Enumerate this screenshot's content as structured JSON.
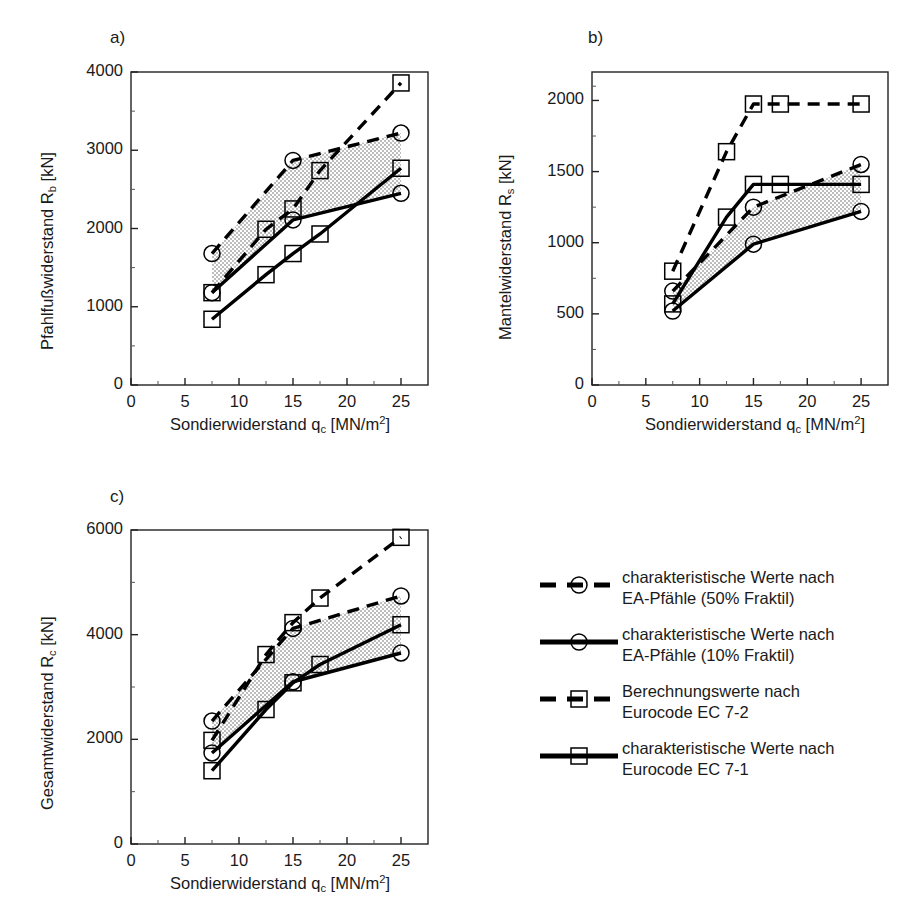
{
  "figure": {
    "panels": [
      {
        "tag": "a)",
        "ylabel_text": "Pfahlfußwiderstand R",
        "ylabel_sub": "b",
        "ylabel_unit": " [kN]"
      },
      {
        "tag": "b)",
        "ylabel_text": "Mantelwiderstand R",
        "ylabel_sub": "s",
        "ylabel_unit": " [kN]"
      },
      {
        "tag": "c)",
        "ylabel_text": "Gesamtwiderstand R",
        "ylabel_sub": "c",
        "ylabel_unit": " [kN]"
      }
    ],
    "xlabel_text": "Sondierwiderstand q",
    "xlabel_sub": "c",
    "xlabel_unit": " [MN/m",
    "xlabel_sup": "2",
    "xlabel_close": "]"
  },
  "legend": {
    "items": [
      {
        "label": "charakteristische Werte nach\nEA-Pfähle (50% Fraktil)",
        "marker": "circle",
        "style": "dashed"
      },
      {
        "label": "charakteristische Werte nach\nEA-Pfähle (10% Fraktil)",
        "marker": "circle",
        "style": "solid"
      },
      {
        "label": "Berechnungswerte nach\nEurocode EC 7-2",
        "marker": "square",
        "style": "dashed"
      },
      {
        "label": "charakteristische Werte nach\nEurocode EC 7-1",
        "marker": "square",
        "style": "solid"
      }
    ]
  },
  "chart_data": [
    {
      "id": "a",
      "type": "line",
      "title": "a)",
      "xlabel": "Sondierwiderstand qc [MN/m2]",
      "ylabel": "Pfahlfußwiderstand Rb [kN]",
      "xlim": [
        0,
        27.5
      ],
      "ylim": [
        0,
        4000
      ],
      "xticks": [
        0,
        5,
        10,
        15,
        20,
        25
      ],
      "yticks": [
        0,
        1000,
        2000,
        3000,
        4000
      ],
      "grid": false,
      "series": [
        {
          "name": "charakteristische Werte nach EA-Pfähle (50% Fraktil)",
          "marker": "circle",
          "style": "dashed",
          "x": [
            7.5,
            15,
            25
          ],
          "values": [
            1680,
            2870,
            3220
          ]
        },
        {
          "name": "charakteristische Werte nach EA-Pfähle (10% Fraktil)",
          "marker": "circle",
          "style": "solid",
          "x": [
            7.5,
            15,
            25
          ],
          "values": [
            1180,
            2110,
            2450
          ]
        },
        {
          "name": "Berechnungswerte nach Eurocode EC 7-2",
          "marker": "square",
          "style": "dashed",
          "x": [
            7.5,
            12.5,
            15,
            17.5,
            25
          ],
          "values": [
            1180,
            1990,
            2250,
            2740,
            3860
          ]
        },
        {
          "name": "charakteristische Werte nach Eurocode EC 7-1",
          "marker": "square",
          "style": "solid",
          "x": [
            7.5,
            12.5,
            15,
            17.5,
            25
          ],
          "values": [
            840,
            1410,
            1680,
            1930,
            2770
          ]
        }
      ],
      "band_note": "stippled band between EA-Pfähle 50% and 10% curves"
    },
    {
      "id": "b",
      "type": "line",
      "title": "b)",
      "xlabel": "Sondierwiderstand qc [MN/m2]",
      "ylabel": "Mantelwiderstand Rs [kN]",
      "xlim": [
        0,
        27.5
      ],
      "ylim": [
        0,
        2200
      ],
      "xticks": [
        0,
        5,
        10,
        15,
        20,
        25
      ],
      "yticks": [
        0,
        500,
        1000,
        1500,
        2000
      ],
      "grid": false,
      "series": [
        {
          "name": "charakteristische Werte nach EA-Pfähle (50% Fraktil)",
          "marker": "circle",
          "style": "dashed",
          "x": [
            7.5,
            15,
            25
          ],
          "values": [
            660,
            1250,
            1550
          ]
        },
        {
          "name": "charakteristische Werte nach EA-Pfähle (10% Fraktil)",
          "marker": "circle",
          "style": "solid",
          "x": [
            7.5,
            15,
            25
          ],
          "values": [
            520,
            990,
            1220
          ]
        },
        {
          "name": "Berechnungswerte nach Eurocode EC 7-2",
          "marker": "square",
          "style": "dashed",
          "x": [
            7.5,
            12.5,
            15,
            17.5,
            25
          ],
          "values": [
            800,
            1640,
            1975,
            1975,
            1975
          ]
        },
        {
          "name": "charakteristische Werte nach Eurocode EC 7-1",
          "marker": "square",
          "style": "solid",
          "x": [
            7.5,
            12.5,
            15,
            17.5,
            25
          ],
          "values": [
            570,
            1180,
            1410,
            1410,
            1410
          ]
        }
      ],
      "band_note": "stippled band between EA-Pfähle 50% and 10% curves"
    },
    {
      "id": "c",
      "type": "line",
      "title": "c)",
      "xlabel": "Sondierwiderstand qc [MN/m2]",
      "ylabel": "Gesamtwiderstand Rc [kN]",
      "xlim": [
        0,
        27.5
      ],
      "ylim": [
        0,
        6000
      ],
      "xticks": [
        0,
        5,
        10,
        15,
        20,
        25
      ],
      "yticks": [
        0,
        2000,
        4000,
        6000
      ],
      "grid": false,
      "series": [
        {
          "name": "charakteristische Werte nach EA-Pfähle (50% Fraktil)",
          "marker": "circle",
          "style": "dashed",
          "x": [
            7.5,
            15,
            25
          ],
          "values": [
            2350,
            4120,
            4740
          ]
        },
        {
          "name": "charakteristische Werte nach EA-Pfähle (10% Fraktil)",
          "marker": "circle",
          "style": "solid",
          "x": [
            7.5,
            15,
            25
          ],
          "values": [
            1740,
            3100,
            3650
          ]
        },
        {
          "name": "Berechnungswerte nach Eurocode EC 7-2",
          "marker": "square",
          "style": "dashed",
          "x": [
            7.5,
            12.5,
            15,
            17.5,
            25
          ],
          "values": [
            1980,
            3620,
            4230,
            4700,
            5860
          ]
        },
        {
          "name": "charakteristische Werte nach Eurocode EC 7-1",
          "marker": "square",
          "style": "solid",
          "x": [
            7.5,
            12.5,
            15,
            17.5,
            25
          ],
          "values": [
            1400,
            2570,
            3080,
            3430,
            4190
          ]
        }
      ],
      "band_note": "stippled band between EA-Pfähle 50% and 10% curves"
    }
  ]
}
